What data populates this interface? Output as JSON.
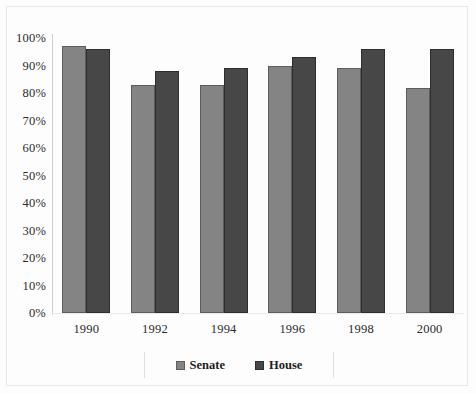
{
  "chart_data": {
    "type": "bar",
    "title": "",
    "subtitle": "",
    "xlabel": "",
    "ylabel": "",
    "categories": [
      "1990",
      "1992",
      "1994",
      "1996",
      "1998",
      "2000"
    ],
    "series": [
      {
        "name": "Senate",
        "color": "#848484",
        "values": [
          97,
          83,
          83,
          90,
          89,
          82
        ]
      },
      {
        "name": "House",
        "color": "#474747",
        "values": [
          96,
          88,
          89,
          93,
          96,
          96
        ]
      }
    ],
    "ylim": [
      0,
      100
    ],
    "ytick_labels": [
      "100%",
      "90%",
      "80%",
      "70%",
      "60%",
      "50%",
      "40%",
      "30%",
      "20%",
      "10%",
      "0%"
    ],
    "ytick_values": [
      100,
      90,
      80,
      70,
      60,
      50,
      40,
      30,
      20,
      10,
      0
    ],
    "grid": false,
    "legend_position": "bottom",
    "legend_entries": [
      "Senate",
      "House"
    ],
    "annotations": []
  }
}
